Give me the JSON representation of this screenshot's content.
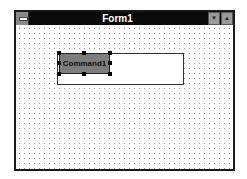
{
  "window": {
    "title": "Form1",
    "icons": {
      "system_menu": "system-menu-icon",
      "minimize": "minimize-icon",
      "maximize": "maximize-icon"
    },
    "min_glyph": "▼",
    "max_glyph": "▲"
  },
  "form": {
    "controls": [
      {
        "type": "command-button",
        "label": "Command1",
        "selected": true
      },
      {
        "type": "text-box",
        "value": ""
      }
    ]
  }
}
